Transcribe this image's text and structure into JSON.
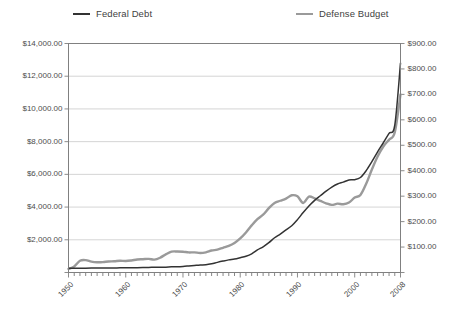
{
  "chart_data": {
    "type": "line",
    "title": "",
    "xlabel": "",
    "ylabel": "",
    "grid": true,
    "legend_position": "top",
    "x": [
      1950,
      1951,
      1952,
      1953,
      1954,
      1955,
      1956,
      1957,
      1958,
      1959,
      1960,
      1961,
      1962,
      1963,
      1964,
      1965,
      1966,
      1967,
      1968,
      1969,
      1970,
      1971,
      1972,
      1973,
      1974,
      1975,
      1976,
      1977,
      1978,
      1979,
      1980,
      1981,
      1982,
      1983,
      1984,
      1985,
      1986,
      1987,
      1988,
      1989,
      1990,
      1991,
      1992,
      1993,
      1994,
      1995,
      1996,
      1997,
      1998,
      1999,
      2000,
      2001,
      2002,
      2003,
      2004,
      2005,
      2006,
      2007,
      2008
    ],
    "xlim": [
      1950,
      2008
    ],
    "xticks": [
      1950,
      1960,
      1970,
      1980,
      1990,
      2000,
      2008
    ],
    "xtick_labels": [
      "1950",
      "1960",
      "1970",
      "1980",
      "1990",
      "2000",
      "2008"
    ],
    "series": [
      {
        "name": "Federal Debt",
        "axis": "left",
        "color": "#333333",
        "unit": "billions USD",
        "values": [
          257,
          255,
          259,
          266,
          271,
          274,
          273,
          271,
          276,
          285,
          286,
          289,
          298,
          306,
          312,
          317,
          320,
          326,
          348,
          354,
          371,
          398,
          427,
          458,
          475,
          533,
          620,
          699,
          772,
          827,
          908,
          998,
          1142,
          1377,
          1572,
          1823,
          2125,
          2350,
          2602,
          2857,
          3233,
          3665,
          4065,
          4411,
          4693,
          4974,
          5225,
          5413,
          5526,
          5656,
          5674,
          5807,
          6228,
          6783,
          7379,
          7933,
          8507,
          9008,
          12800
        ]
      },
      {
        "name": "Defense Budget",
        "axis": "right",
        "color": "#9a9a9a",
        "unit": "billions USD",
        "values": [
          13.7,
          23.6,
          46.1,
          48.7,
          42.8,
          40.2,
          40.7,
          43.3,
          44.2,
          46.4,
          45.2,
          47.4,
          51.1,
          52.3,
          53.6,
          50.6,
          58.1,
          71.4,
          81.9,
          82.5,
          81.7,
          78.9,
          79.2,
          76.7,
          79.3,
          86.5,
          89.6,
          97.2,
          104.5,
          116.3,
          134,
          157.5,
          185.3,
          209.9,
          227.4,
          252.7,
          273.4,
          282,
          290.4,
          303.6,
          299.3,
          273.3,
          298.3,
          291.1,
          281.6,
          272.1,
          265.7,
          270.5,
          268.2,
          274.8,
          294.4,
          304.7,
          348.5,
          404.7,
          455.8,
          495.3,
          521.8,
          551.2,
          700
        ]
      }
    ],
    "left_axis": {
      "ticks": [
        0,
        2000,
        4000,
        6000,
        8000,
        10000,
        12000,
        14000
      ],
      "tick_labels": [
        "",
        "$2,000.00",
        "$4,000.00",
        "$6,000.00",
        "$8,000.00",
        "$10,000.00",
        "$12,000.00",
        "$14,000.00"
      ],
      "min": 0,
      "max": 14000
    },
    "right_axis": {
      "ticks": [
        0,
        100,
        200,
        300,
        400,
        500,
        600,
        700,
        800,
        900
      ],
      "tick_labels": [
        "",
        "$100.00",
        "$200.00",
        "$300.00",
        "$400.00",
        "$500.00",
        "$600.00",
        "$700.00",
        "$800.00",
        "$900.00"
      ],
      "min": 0,
      "max": 900
    }
  },
  "legend": {
    "items": [
      {
        "label": "Federal Debt",
        "color": "#333333"
      },
      {
        "label": "Defense Budget",
        "color": "#9a9a9a"
      }
    ]
  },
  "colors": {
    "background": "#ffffff",
    "gridline": "#c9c9c9",
    "frame": "#808080",
    "text": "#4d4d4d",
    "federal_debt": "#333333",
    "defense_budget": "#9a9a9a"
  }
}
